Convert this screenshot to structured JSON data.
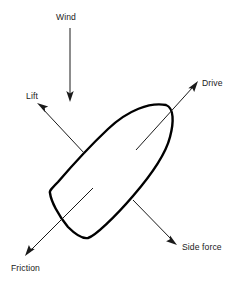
{
  "diagram": {
    "background_color": "#ffffff",
    "line_color": "#1a1a1a",
    "hull_color": "#000000",
    "labels": {
      "wind": "Wind",
      "lift": "Lift",
      "drive": "Drive",
      "side_force": "Side force",
      "friction": "Friction"
    },
    "vectors": [
      {
        "name": "wind",
        "label": "Wind",
        "direction": "down",
        "tail": [
          70,
          28
        ],
        "tip": [
          70,
          100
        ],
        "label_pos": [
          56,
          20
        ]
      },
      {
        "name": "lift",
        "label": "Lift",
        "direction": "up-left",
        "tail": [
          84,
          153
        ],
        "tip": [
          38,
          104
        ],
        "label_pos": [
          26,
          99
        ]
      },
      {
        "name": "drive",
        "label": "Drive",
        "direction": "up-right",
        "tail": [
          136,
          150
        ],
        "tip": [
          197,
          82
        ],
        "label_pos": [
          202,
          86
        ]
      },
      {
        "name": "side_force",
        "label": "Side force",
        "direction": "down-right",
        "tail": [
          133,
          200
        ],
        "tip": [
          176,
          244
        ],
        "label_pos": [
          182,
          250
        ]
      },
      {
        "name": "friction",
        "label": "Friction",
        "direction": "down-left",
        "tail": [
          92,
          189
        ],
        "tip": [
          26,
          255
        ],
        "label_pos": [
          11,
          271
        ]
      }
    ],
    "hull": {
      "name": "boat-hull",
      "bow_tip": [
        166,
        105
      ],
      "stern_port": [
        50,
        192
      ],
      "stern_bottom": [
        88,
        238
      ]
    }
  }
}
